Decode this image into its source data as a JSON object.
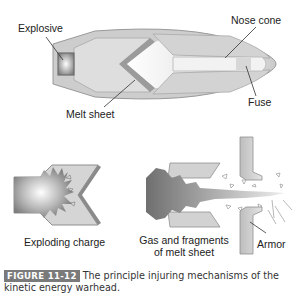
{
  "figure": {
    "badge": "FIGURE 11-12",
    "caption": "The principle injuring mechanisms of the kinetic energy warhead."
  },
  "top_diagram": {
    "labels": {
      "explosive": "Explosive",
      "nose_cone": "Nose cone",
      "melt_sheet": "Melt sheet",
      "fuse": "Fuse"
    }
  },
  "bottom_diagrams": {
    "left_label": "Exploding charge",
    "middle_label_line1": "Gas and fragments",
    "middle_label_line2": "of melt sheet",
    "armor_label": "Armor"
  },
  "colors": {
    "shell_outer": "#c8c8c8",
    "shell_fill": "#d9d9d9",
    "dark_edge": "#8e8e8e",
    "caption_badge": "#7a7a7a"
  }
}
